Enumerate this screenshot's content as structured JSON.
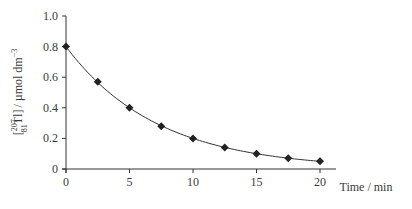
{
  "chart_data": {
    "type": "line",
    "title": "",
    "xlabel": "Time / min",
    "ylabel": "[207 81 Tl] / µmol dm−3",
    "ylabel_parts": {
      "open": "[",
      "mass": "207",
      "atomic": "81",
      "symbol": "Tl",
      "close": "]",
      "unit": "/ µmol dm",
      "exp": "−3"
    },
    "xlim": [
      0,
      20
    ],
    "ylim": [
      0,
      1.0
    ],
    "xticks": [
      0,
      5,
      10,
      15,
      20
    ],
    "yticks": [
      0,
      0.2,
      0.4,
      0.6,
      0.8,
      1.0
    ],
    "xtick_labels": [
      "0",
      "5",
      "10",
      "15",
      "20"
    ],
    "ytick_labels": [
      "0",
      "0.2",
      "0.4",
      "0.6",
      "0.8",
      "1.0"
    ],
    "grid": false,
    "legend": null,
    "marker": "diamond",
    "series": [
      {
        "name": "Tl-207 concentration",
        "x": [
          0,
          2.5,
          5,
          7.5,
          10,
          12.5,
          15,
          17.5,
          20
        ],
        "values": [
          0.8,
          0.57,
          0.4,
          0.28,
          0.2,
          0.14,
          0.1,
          0.07,
          0.05
        ]
      }
    ],
    "fit_curve": "exponential decay, half-life ≈ 5 min"
  },
  "colors": {
    "line": "#333333",
    "marker": "#222222",
    "axis": "#333333"
  }
}
